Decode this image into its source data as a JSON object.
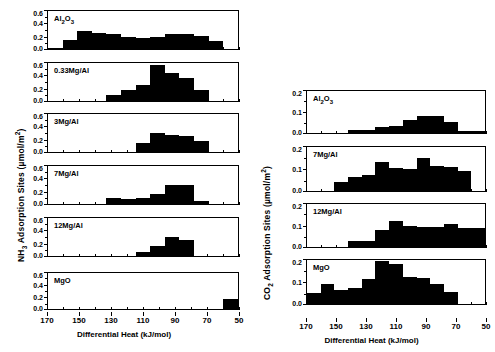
{
  "figure": {
    "background": "#ffffff",
    "bar_color": "#000000"
  },
  "left_column": {
    "ylabel_prefix": "NH",
    "ylabel_sub": "3",
    "ylabel_rest": " Adsorption Sites (µmol/m",
    "ylabel_sup": "2",
    "ylabel_close": ")",
    "xlabel": "Differential Heat (kJ/mol)",
    "xticks": [
      "170",
      "150",
      "130",
      "110",
      "90",
      "70",
      "50"
    ],
    "yticks": [
      "0.6",
      "0.4",
      "0.2",
      "0.0"
    ]
  },
  "right_column": {
    "ylabel_prefix": "CO",
    "ylabel_sub": "2",
    "ylabel_rest": " Adsorption Sites (µmol/m",
    "ylabel_sup": "2",
    "ylabel_close": ")",
    "xlabel": "Differential Heat (kJ/mol)",
    "xticks": [
      "170",
      "150",
      "130",
      "110",
      "90",
      "70",
      "50"
    ],
    "yticks": [
      "0.2",
      "0.1",
      "0.0"
    ]
  },
  "chart_data": [
    {
      "type": "bar",
      "panel_id": "nh3-al2o3",
      "column": "left",
      "title": "Al₂O₃",
      "label_main": "Al",
      "label_sub1": "2",
      "label_mid": "O",
      "label_sub2": "3",
      "xlabel": "Differential Heat (kJ/mol)",
      "ylabel": "NH3 Adsorption Sites (µmol/m2)",
      "ylim": [
        0,
        0.6
      ],
      "xlim": [
        175,
        45
      ],
      "bin_centers": [
        170,
        160,
        150,
        140,
        130,
        120,
        110,
        100,
        90,
        80,
        70,
        60,
        50
      ],
      "values": [
        0.02,
        0.14,
        0.29,
        0.25,
        0.23,
        0.19,
        0.18,
        0.19,
        0.24,
        0.24,
        0.21,
        0.13,
        0.0
      ]
    },
    {
      "type": "bar",
      "panel_id": "nh3-033mgal",
      "column": "left",
      "title": "0.33Mg/Al",
      "xlabel": "Differential Heat (kJ/mol)",
      "ylabel": "NH3 Adsorption Sites (µmol/m2)",
      "ylim": [
        0,
        0.6
      ],
      "xlim": [
        175,
        45
      ],
      "bin_centers": [
        170,
        160,
        150,
        140,
        130,
        120,
        110,
        100,
        90,
        80,
        70,
        60,
        50
      ],
      "values": [
        0.0,
        0.0,
        0.0,
        0.0,
        0.1,
        0.17,
        0.26,
        0.57,
        0.45,
        0.36,
        0.18,
        0.0,
        0.0
      ]
    },
    {
      "type": "bar",
      "panel_id": "nh3-3mgal",
      "column": "left",
      "title": "3Mg/Al",
      "xlabel": "Differential Heat (kJ/mol)",
      "ylabel": "NH3 Adsorption Sites (µmol/m2)",
      "ylim": [
        0,
        0.6
      ],
      "xlim": [
        175,
        45
      ],
      "bin_centers": [
        170,
        160,
        150,
        140,
        130,
        120,
        110,
        100,
        90,
        80,
        70,
        60,
        50
      ],
      "values": [
        0.0,
        0.0,
        0.0,
        0.0,
        0.0,
        0.0,
        0.14,
        0.3,
        0.27,
        0.26,
        0.17,
        0.0,
        0.0
      ]
    },
    {
      "type": "bar",
      "panel_id": "nh3-7mgal",
      "column": "left",
      "title": "7Mg/Al",
      "xlabel": "Differential Heat (kJ/mol)",
      "ylabel": "NH3 Adsorption Sites (µmol/m2)",
      "ylim": [
        0,
        0.6
      ],
      "xlim": [
        175,
        45
      ],
      "bin_centers": [
        170,
        160,
        150,
        140,
        130,
        120,
        110,
        100,
        90,
        80,
        70,
        60,
        50
      ],
      "values": [
        0.0,
        0.0,
        0.0,
        0.0,
        0.1,
        0.08,
        0.09,
        0.16,
        0.3,
        0.3,
        0.04,
        0.0,
        0.0
      ]
    },
    {
      "type": "bar",
      "panel_id": "nh3-12mgal",
      "column": "left",
      "title": "12Mg/Al",
      "xlabel": "Differential Heat (kJ/mol)",
      "ylabel": "NH3 Adsorption Sites (µmol/m2)",
      "ylim": [
        0,
        0.6
      ],
      "xlim": [
        175,
        45
      ],
      "bin_centers": [
        170,
        160,
        150,
        140,
        130,
        120,
        110,
        100,
        90,
        80,
        70,
        60,
        50
      ],
      "values": [
        0.0,
        0.0,
        0.0,
        0.0,
        0.0,
        0.0,
        0.06,
        0.16,
        0.3,
        0.26,
        0.0,
        0.0,
        0.0
      ]
    },
    {
      "type": "bar",
      "panel_id": "nh3-mgo",
      "column": "left",
      "title": "MgO",
      "xlabel": "Differential Heat (kJ/mol)",
      "ylabel": "NH3 Adsorption Sites (µmol/m2)",
      "ylim": [
        0,
        0.6
      ],
      "xlim": [
        175,
        45
      ],
      "bin_centers": [
        170,
        160,
        150,
        140,
        130,
        120,
        110,
        100,
        90,
        80,
        70,
        60,
        50
      ],
      "values": [
        0.0,
        0.0,
        0.0,
        0.0,
        0.0,
        0.0,
        0.0,
        0.0,
        0.0,
        0.0,
        0.0,
        0.0,
        0.17
      ]
    },
    {
      "type": "bar",
      "panel_id": "co2-al2o3",
      "column": "right",
      "title": "Al₂O₃",
      "label_main": "Al",
      "label_sub1": "2",
      "label_mid": "O",
      "label_sub2": "3",
      "xlabel": "Differential Heat (kJ/mol)",
      "ylabel": "CO2 Adsorption Sites (µmol/m2)",
      "ylim": [
        0,
        0.2
      ],
      "xlim": [
        175,
        45
      ],
      "bin_centers": [
        170,
        160,
        150,
        140,
        130,
        120,
        110,
        100,
        90,
        80,
        70,
        60,
        50
      ],
      "values": [
        0.0,
        0.0,
        0.0,
        0.013,
        0.013,
        0.027,
        0.035,
        0.063,
        0.082,
        0.08,
        0.052,
        0.008,
        0.008
      ]
    },
    {
      "type": "bar",
      "panel_id": "co2-7mgal",
      "column": "right",
      "title": "7Mg/Al",
      "xlabel": "Differential Heat (kJ/mol)",
      "ylabel": "CO2 Adsorption Sites (µmol/m2)",
      "ylim": [
        0,
        0.2
      ],
      "xlim": [
        175,
        45
      ],
      "bin_centers": [
        170,
        160,
        150,
        140,
        130,
        120,
        110,
        100,
        90,
        80,
        70,
        60,
        50
      ],
      "values": [
        0.0,
        0.0,
        0.04,
        0.062,
        0.075,
        0.131,
        0.105,
        0.098,
        0.152,
        0.112,
        0.108,
        0.093,
        0.0
      ]
    },
    {
      "type": "bar",
      "panel_id": "co2-12mgal",
      "column": "right",
      "title": "12Mg/Al",
      "xlabel": "Differential Heat (kJ/mol)",
      "ylabel": "CO2 Adsorption Sites (µmol/m2)",
      "ylim": [
        0,
        0.2
      ],
      "xlim": [
        175,
        45
      ],
      "bin_centers": [
        170,
        160,
        150,
        140,
        130,
        120,
        110,
        100,
        90,
        80,
        70,
        60,
        50
      ],
      "values": [
        0.0,
        0.0,
        0.0,
        0.028,
        0.028,
        0.078,
        0.122,
        0.1,
        0.095,
        0.091,
        0.108,
        0.09,
        0.09
      ]
    },
    {
      "type": "bar",
      "panel_id": "co2-mgo",
      "column": "right",
      "title": "MgO",
      "xlabel": "Differential Heat (kJ/mol)",
      "ylabel": "CO2 Adsorption Sites (µmol/m2)",
      "ylim": [
        0,
        0.2
      ],
      "xlim": [
        175,
        45
      ],
      "bin_centers": [
        170,
        160,
        150,
        140,
        130,
        120,
        110,
        100,
        90,
        80,
        70,
        60,
        50
      ],
      "values": [
        0.05,
        0.092,
        0.065,
        0.075,
        0.112,
        0.195,
        0.183,
        0.125,
        0.118,
        0.09,
        0.055,
        0.0,
        0.0
      ]
    }
  ]
}
